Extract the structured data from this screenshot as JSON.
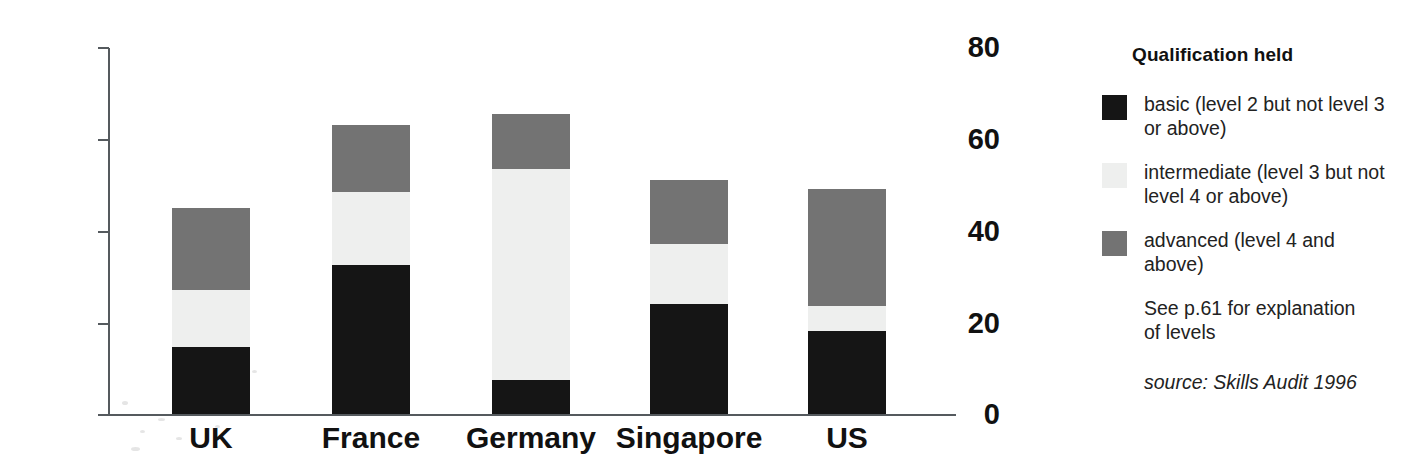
{
  "chart_data": {
    "type": "bar",
    "stacked": true,
    "title": "",
    "xlabel": "",
    "ylabel": "",
    "ylim": [
      0,
      80
    ],
    "yticks": [
      0,
      20,
      40,
      60,
      80
    ],
    "grid": false,
    "legend_position": "right",
    "categories": [
      "UK",
      "France",
      "Germany",
      "Singapore",
      "US"
    ],
    "series": [
      {
        "name": "basic (level 2 but not level 3 or above)",
        "key": "basic",
        "color": "#151515",
        "values": [
          14.5,
          32.5,
          7.5,
          24,
          18
        ]
      },
      {
        "name": "intermediate (level 3 but not level 4 or above)",
        "key": "intermediate",
        "color": "#eeefee",
        "values": [
          12.5,
          16,
          46,
          13,
          5.5
        ]
      },
      {
        "name": "advanced (level 4 and above)",
        "key": "advanced",
        "color": "#737373",
        "values": [
          18,
          14.5,
          12,
          14,
          25.5
        ]
      }
    ],
    "totals": [
      45,
      63,
      65.5,
      51,
      49
    ],
    "annotations": [
      "See p.61 for explanation of levels",
      "source: Skills Audit 1996"
    ]
  },
  "axis": {
    "y_tick_labels": [
      "80",
      "60",
      "40",
      "20",
      "0"
    ],
    "x_tick_labels": [
      "UK",
      "France",
      "Germany",
      "Singapore",
      "US"
    ]
  },
  "legend": {
    "title": "Qualification held",
    "items": [
      {
        "swatch_name": "legend-swatch-basic",
        "color": "#151515",
        "label": "basic (level 2 but not level 3\nor above)"
      },
      {
        "swatch_name": "legend-swatch-intermediate",
        "color": "#eeefee",
        "label": "intermediate (level 3 but not\nlevel 4 or above)"
      },
      {
        "swatch_name": "legend-swatch-advanced",
        "color": "#737373",
        "label": "advanced (level 4 and\nabove)"
      }
    ],
    "note": "See p.61 for explanation\nof levels",
    "source": "source: Skills Audit 1996"
  },
  "colors": {
    "basic": "#151515",
    "intermediate": "#eeefee",
    "advanced": "#737373",
    "axis": "#555a5e",
    "text": "#111111",
    "background": "#ffffff"
  }
}
